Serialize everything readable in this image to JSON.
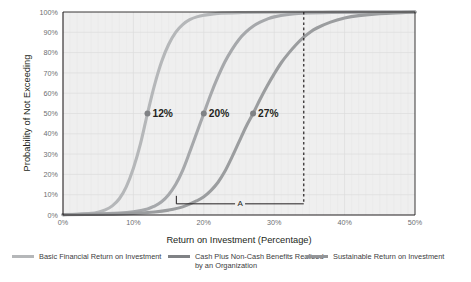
{
  "chart_data": {
    "type": "line",
    "title": "",
    "xlabel": "Return on Investment (Percentage)",
    "ylabel": "Probability of Not Exceeding",
    "xlim": [
      0,
      50
    ],
    "ylim": [
      0,
      100
    ],
    "grid": true,
    "x_ticks": [
      "0%",
      "10%",
      "20%",
      "30%",
      "40%",
      "50%"
    ],
    "x_tick_values": [
      0,
      10,
      20,
      30,
      40,
      50
    ],
    "y_ticks": [
      "0%",
      "10%",
      "20%",
      "30%",
      "40%",
      "50%",
      "60%",
      "70%",
      "80%",
      "90%",
      "100%"
    ],
    "y_tick_values": [
      0,
      10,
      20,
      30,
      40,
      50,
      60,
      70,
      80,
      90,
      100
    ],
    "legend_position": "bottom",
    "series": [
      {
        "name": "Basic Financial Return on Investment",
        "color": "#b5b7b9",
        "median_x": 12,
        "median_label": "12%",
        "points": [
          [
            0,
            0.2
          ],
          [
            2,
            0.4
          ],
          [
            4,
            0.8
          ],
          [
            5,
            1.4
          ],
          [
            6,
            2.5
          ],
          [
            7,
            4.5
          ],
          [
            8,
            8.0
          ],
          [
            9,
            14.0
          ],
          [
            10,
            23.0
          ],
          [
            11,
            35.0
          ],
          [
            12,
            50.0
          ],
          [
            13,
            64.0
          ],
          [
            14,
            75.5
          ],
          [
            15,
            84.0
          ],
          [
            16,
            90.0
          ],
          [
            17,
            93.8
          ],
          [
            18,
            96.2
          ],
          [
            19,
            97.6
          ],
          [
            20,
            98.4
          ],
          [
            22,
            99.3
          ],
          [
            25,
            99.7
          ],
          [
            30,
            99.9
          ],
          [
            40,
            100
          ],
          [
            50,
            100
          ]
        ]
      },
      {
        "name": "Cash Plus Non-Cash Benefits Realized by an Organization",
        "color": "#a6a8ab",
        "median_x": 20,
        "median_label": "20%",
        "points": [
          [
            0,
            0.2
          ],
          [
            4,
            0.4
          ],
          [
            8,
            0.9
          ],
          [
            10,
            1.6
          ],
          [
            12,
            3.0
          ],
          [
            13,
            4.4
          ],
          [
            14,
            6.5
          ],
          [
            15,
            10.0
          ],
          [
            16,
            15.0
          ],
          [
            17,
            22.0
          ],
          [
            18,
            31.0
          ],
          [
            19,
            40.5
          ],
          [
            20,
            50.0
          ],
          [
            21,
            59.5
          ],
          [
            22,
            68.0
          ],
          [
            23,
            75.5
          ],
          [
            24,
            81.5
          ],
          [
            25,
            86.5
          ],
          [
            26,
            90.2
          ],
          [
            27,
            93.0
          ],
          [
            28,
            95.0
          ],
          [
            29,
            96.5
          ],
          [
            30,
            97.6
          ],
          [
            32,
            98.8
          ],
          [
            34,
            99.4
          ],
          [
            38,
            99.8
          ],
          [
            44,
            100
          ],
          [
            50,
            100
          ]
        ]
      },
      {
        "name": "Sustainable Return on Investment",
        "color": "#9b9d9f",
        "median_x": 27,
        "median_label": "27%",
        "points": [
          [
            0,
            0.2
          ],
          [
            6,
            0.4
          ],
          [
            10,
            0.8
          ],
          [
            13,
            1.5
          ],
          [
            15,
            2.4
          ],
          [
            17,
            4.0
          ],
          [
            19,
            7.0
          ],
          [
            20,
            9.0
          ],
          [
            21,
            12.0
          ],
          [
            22,
            16.0
          ],
          [
            23,
            21.5
          ],
          [
            24,
            28.5
          ],
          [
            25,
            36.0
          ],
          [
            26,
            43.5
          ],
          [
            27,
            50.0
          ],
          [
            28,
            57.0
          ],
          [
            29,
            63.5
          ],
          [
            30,
            69.5
          ],
          [
            31,
            75.0
          ],
          [
            32,
            79.5
          ],
          [
            33,
            83.5
          ],
          [
            34,
            87.0
          ],
          [
            35,
            89.8
          ],
          [
            36,
            92.0
          ],
          [
            38,
            95.0
          ],
          [
            40,
            97.0
          ],
          [
            42,
            98.2
          ],
          [
            45,
            99.2
          ],
          [
            48,
            99.7
          ],
          [
            50,
            100
          ]
        ]
      }
    ],
    "annotations": {
      "bracket": {
        "label": "A",
        "x_start": 16.1,
        "x_end": 34.2,
        "y": 5.5
      },
      "dashed_line": {
        "x": 34.2,
        "y_top": 100,
        "y_bottom": 5.5
      },
      "markers": [
        {
          "label": "12%",
          "x": 12,
          "y": 50
        },
        {
          "label": "20%",
          "x": 20,
          "y": 50
        },
        {
          "label": "27%",
          "x": 27,
          "y": 50
        }
      ]
    },
    "colors": {
      "plot_background": "#efefef",
      "grid": "#e2e2e2",
      "axis": "#231f20",
      "marker": "#808285",
      "text": "#231f20",
      "tick_text": "#6d6e71"
    }
  },
  "legend": {
    "items": [
      {
        "label": "Basic Financial Return on Investment",
        "color": "#b5b7b9"
      },
      {
        "label": "Cash Plus Non-Cash Benefits Realized by an Organization",
        "color": "#808285"
      },
      {
        "label": "Sustainable Return on Investment",
        "color": "#939598"
      }
    ]
  }
}
